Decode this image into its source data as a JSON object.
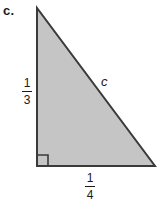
{
  "figure": {
    "part_label": "c.",
    "shape_name": "right-triangle",
    "background_color": "#ffffff",
    "fill_color": "#c5c5c5",
    "stroke_color": "#3a3a3a",
    "stroke_width": 2,
    "vertices": {
      "apex": [
        37,
        8
      ],
      "bottom_left": [
        37,
        166
      ],
      "bottom_right": [
        155,
        166
      ]
    },
    "right_angle_marker": {
      "name": "right-angle-marker",
      "corner": [
        37,
        166
      ],
      "size": 11
    },
    "labels": {
      "vertical_leg": {
        "numerator": "1",
        "denominator": "3"
      },
      "horizontal_leg": {
        "numerator": "1",
        "denominator": "4"
      },
      "hypotenuse": "c"
    }
  }
}
